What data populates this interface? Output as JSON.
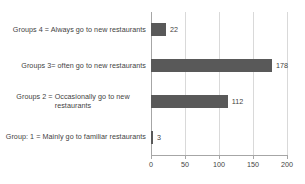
{
  "chart_data": {
    "type": "bar",
    "orientation": "horizontal",
    "title": "",
    "xlabel": "",
    "ylabel": "",
    "categories": [
      "Groups 4 = Always go to new restaurants",
      "Groups 3= often go to new restaurants",
      "Groups 2 = Occasionally go to new restaurants",
      "Group: 1 = Mainly go to familiar restaurants"
    ],
    "values": [
      22,
      178,
      112,
      3
    ],
    "value_labels": [
      "22",
      "178",
      "112",
      "3"
    ],
    "xlim": [
      0,
      200
    ],
    "xticks": [
      0,
      50,
      100,
      150,
      200
    ],
    "xtick_labels": [
      "0",
      "50",
      "100",
      "150",
      "200"
    ],
    "grid": "vertical",
    "legend": "none",
    "bar_color": "#595959",
    "gridline_color": "#d9d9d9",
    "axis_color": "#a6a6a6",
    "text_color": "#3f3f3f",
    "background": "#ffffff"
  }
}
